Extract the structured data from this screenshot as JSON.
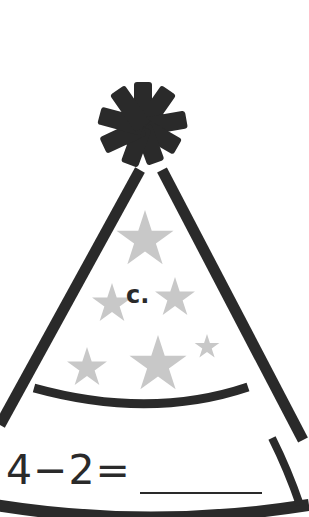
{
  "worksheet": {
    "item_label": "c.",
    "equation": "4−2=",
    "answer_blank": "",
    "colors": {
      "ink": "#2a2a2a",
      "stars": "#c8c8c8",
      "background": "#ffffff"
    }
  },
  "icons": [
    "pom-pom-icon",
    "party-hat-icon",
    "star-icon"
  ]
}
